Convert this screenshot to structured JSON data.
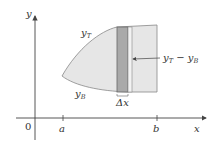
{
  "diagram": {
    "type": "area-between-curves",
    "labels": {
      "y_axis": "y",
      "x_axis": "x",
      "origin": "0",
      "a": "a",
      "b": "b",
      "top_curve": "y",
      "top_curve_sub": "T",
      "bottom_curve": "y",
      "bottom_curve_sub": "B",
      "strip_height": "y",
      "strip_height_sub1": "T",
      "strip_height_minus": " − y",
      "strip_height_sub2": "B",
      "strip_width": "Δx"
    },
    "colors": {
      "region_fill": "#e6e6e6",
      "strip_fill": "#a9a9a9",
      "outline": "#888888",
      "axis": "#444444"
    }
  }
}
